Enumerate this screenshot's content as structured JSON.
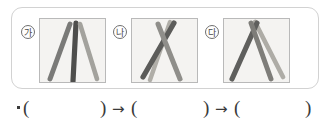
{
  "worksheet": {
    "panel_group": {
      "figures": [
        {
          "marker": "가",
          "marker_name": "circled-ga",
          "caption": "",
          "description": "three sticks forming an A-frame: left diagonal, center vertical, right diagonal",
          "strokes": [
            {
              "name": "stick-left",
              "x1": 10,
              "y1": 60,
              "x2": 30,
              "y2": 5,
              "width": 5.0,
              "color": "#7a7a78"
            },
            {
              "name": "stick-center",
              "x1": 33,
              "y1": 62,
              "x2": 36,
              "y2": 4,
              "width": 5.2,
              "color": "#4e4e4c"
            },
            {
              "name": "stick-right",
              "x1": 57,
              "y1": 60,
              "x2": 40,
              "y2": 5,
              "width": 4.6,
              "color": "#a3a29d"
            }
          ]
        },
        {
          "marker": "나",
          "marker_name": "circled-na",
          "caption": "",
          "description": "two sticks crossing near the top forming an X over a narrow A",
          "strokes": [
            {
              "name": "stick-left",
              "x1": 11,
              "y1": 58,
              "x2": 42,
              "y2": 4,
              "width": 5.2,
              "color": "#5c5c5a"
            },
            {
              "name": "stick-right",
              "x1": 48,
              "y1": 60,
              "x2": 26,
              "y2": 5,
              "width": 5.0,
              "color": "#8f8e8a"
            },
            {
              "name": "stick-cross",
              "x1": 18,
              "y1": 61,
              "x2": 38,
              "y2": 3,
              "width": 4.4,
              "color": "#b0aea8"
            }
          ]
        },
        {
          "marker": "다",
          "marker_name": "circled-da",
          "caption": "",
          "description": "two sticks crossing at the apex plus a third leaning right, forming a wide A",
          "strokes": [
            {
              "name": "stick-left",
              "x1": 8,
              "y1": 60,
              "x2": 33,
              "y2": 4,
              "width": 5.2,
              "color": "#5f5f5d"
            },
            {
              "name": "stick-right",
              "x1": 47,
              "y1": 60,
              "x2": 27,
              "y2": 4,
              "width": 5.0,
              "color": "#7e7d79"
            },
            {
              "name": "stick-outer",
              "x1": 59,
              "y1": 58,
              "x2": 31,
              "y2": 3,
              "width": 4.6,
              "color": "#aeaca6"
            }
          ]
        }
      ]
    },
    "answer_line": {
      "bullet": "•",
      "paren_open": "(",
      "paren_close": ")",
      "arrow": "→",
      "blank_1": "",
      "blank_2": "",
      "blank_3": ""
    }
  }
}
